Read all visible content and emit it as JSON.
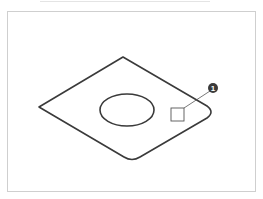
{
  "diagram": {
    "title": "",
    "frame_color": "#cfcfcf",
    "stroke_color": "#3a3a3a",
    "shape": "rhombus-plate-with-ellipse-hole",
    "callouts": [
      {
        "number": "1",
        "label": "❶",
        "target": "square-marker"
      }
    ]
  }
}
